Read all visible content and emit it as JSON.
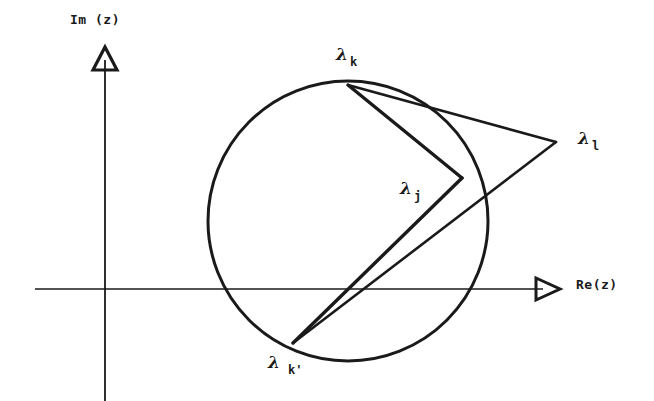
{
  "figure": {
    "width": 654,
    "height": 401,
    "background_color": "#ffffff",
    "ink_color": "#1a1a1a"
  },
  "axes": {
    "imaginary": {
      "label": "Im (z)",
      "label_x": 70,
      "label_y": 12,
      "x": 105,
      "y_top": 48,
      "y_bottom": 401,
      "arrow": "open-triangle-up"
    },
    "real": {
      "label": "Re(z)",
      "label_x": 576,
      "label_y": 277,
      "y": 289,
      "x_left": 35,
      "x_right": 551,
      "arrow": "open-triangle-right"
    }
  },
  "circle": {
    "name": "unit-circle",
    "center_x": 348,
    "center_y": 221,
    "radius": 140,
    "stroke_width": 3
  },
  "points": [
    {
      "id": "lambda-k",
      "lambda": "λ",
      "subscript": "k",
      "x": 348,
      "y": 85,
      "label_x": 336,
      "label_y": 44
    },
    {
      "id": "lambda-l",
      "lambda": "λ",
      "subscript": "l",
      "x": 556,
      "y": 142,
      "label_x": 578,
      "label_y": 128
    },
    {
      "id": "lambda-j",
      "lambda": "λ",
      "subscript": "j",
      "x": 462,
      "y": 178,
      "label_x": 400,
      "label_y": 178
    },
    {
      "id": "lambda-k-prime",
      "lambda": "λ",
      "subscript": "k'",
      "x": 293,
      "y": 343,
      "label_x": 268,
      "label_y": 352
    }
  ],
  "polyline_paths": [
    {
      "id": "path-k-to-l",
      "from": "lambda-k",
      "to": "lambda-l",
      "points": "348,85 556,142"
    },
    {
      "id": "path-l-to-kprime",
      "from": "lambda-l",
      "to": "lambda-k-prime",
      "points": "556,142 293,343"
    },
    {
      "id": "path-k-to-j",
      "from": "lambda-k",
      "to": "lambda-j",
      "points": "348,85 462,178"
    },
    {
      "id": "path-j-to-kprime",
      "from": "lambda-j",
      "to": "lambda-k-prime",
      "points": "462,178 293,343"
    }
  ]
}
